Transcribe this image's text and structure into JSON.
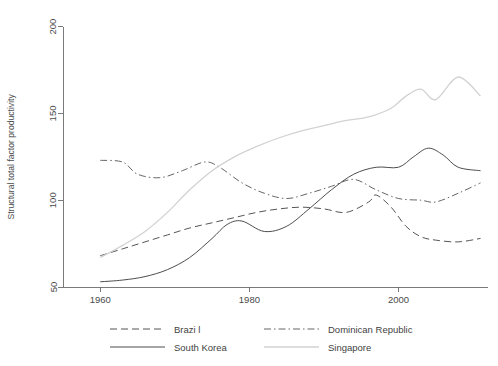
{
  "chart_data": {
    "type": "line",
    "title": "",
    "xlabel": "",
    "ylabel": "Structural total factor productivity",
    "xlim": [
      1955,
      2012
    ],
    "ylim": [
      50,
      205
    ],
    "xticks": [
      1960,
      1980,
      2000
    ],
    "xtick_labels": [
      "1960",
      "1980",
      "2000"
    ],
    "yticks": [
      50,
      100,
      150,
      200
    ],
    "ytick_labels": [
      "50",
      "100",
      "150",
      "200"
    ],
    "grid": false,
    "legend_position": "bottom",
    "legend_columns": 2,
    "series": [
      {
        "name": "Brazi l",
        "legend_label": "Brazi l",
        "style": "dashed",
        "color": "#555555",
        "width": 1.0,
        "x": [
          1960,
          1963,
          1966,
          1969,
          1972,
          1975,
          1978,
          1981,
          1984,
          1987,
          1990,
          1993,
          1996,
          1997,
          1999,
          2001,
          2003,
          2005,
          2008,
          2011
        ],
        "y": [
          68,
          72,
          76,
          80,
          84,
          87,
          90,
          93,
          95,
          96,
          95,
          93,
          99,
          103,
          96,
          85,
          79,
          77,
          76,
          78
        ]
      },
      {
        "name": "Dominican Republic",
        "legend_label": "Dominican Republic",
        "style": "dashdot",
        "color": "#666666",
        "width": 1.0,
        "x": [
          1960,
          1963,
          1965,
          1968,
          1971,
          1974,
          1976,
          1979,
          1982,
          1985,
          1988,
          1991,
          1994,
          1997,
          2000,
          2003,
          2005,
          2008,
          2011
        ],
        "y": [
          123,
          122,
          115,
          113,
          117,
          122,
          119,
          110,
          104,
          101,
          104,
          108,
          112,
          106,
          101,
          100,
          99,
          104,
          110
        ]
      },
      {
        "name": "South Korea",
        "legend_label": "South Korea",
        "style": "solid",
        "color": "#4d4d4d",
        "width": 1.0,
        "x": [
          1960,
          1963,
          1966,
          1969,
          1972,
          1975,
          1977,
          1979,
          1982,
          1985,
          1988,
          1991,
          1994,
          1997,
          2000,
          2002,
          2004,
          2006,
          2008,
          2011
        ],
        "y": [
          53,
          54,
          56,
          60,
          67,
          78,
          86,
          88,
          82,
          85,
          95,
          106,
          115,
          119,
          119,
          125,
          130,
          126,
          119,
          117
        ]
      },
      {
        "name": "Singapore",
        "legend_label": "Singapore",
        "style": "solid",
        "color": "#d2d2d2",
        "width": 1.3,
        "x": [
          1960,
          1963,
          1966,
          1969,
          1972,
          1975,
          1978,
          1981,
          1984,
          1987,
          1990,
          1993,
          1996,
          1999,
          2001,
          2003,
          2005,
          2008,
          2011
        ],
        "y": [
          67,
          74,
          82,
          93,
          106,
          117,
          125,
          131,
          136,
          140,
          143,
          146,
          148,
          153,
          160,
          164,
          158,
          171,
          160
        ]
      }
    ]
  },
  "plot": {
    "margin_left": 63,
    "margin_right": 10,
    "margin_top": 18,
    "margin_bottom": 79
  },
  "legend": {
    "entries": [
      {
        "label": "Brazi l",
        "style": "dashed",
        "color": "#555555"
      },
      {
        "label": "Dominican Republic",
        "style": "dashdot",
        "color": "#666666"
      },
      {
        "label": "South Korea",
        "style": "solid",
        "color": "#4d4d4d"
      },
      {
        "label": "Singapore",
        "style": "solid",
        "color": "#d2d2d2"
      }
    ]
  },
  "colors": {
    "axis": "#6b6b6b",
    "text": "#4a4a4a",
    "background": "#ffffff"
  }
}
